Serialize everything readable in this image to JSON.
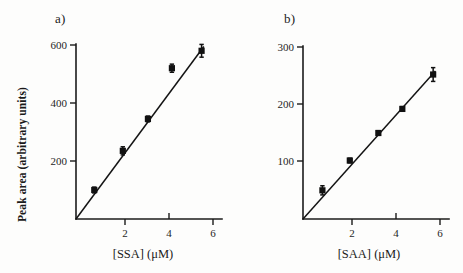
{
  "figure": {
    "background_color": "#fdfdfc",
    "ink_color": "#141414",
    "panel_count": 2
  },
  "panels": {
    "a": {
      "label": "a)",
      "xlabel": "[SSA] (μM)",
      "ylabel": "Peak area (arbitrary units)",
      "xticks": [
        "2",
        "4",
        "6"
      ],
      "yticks": [
        "200",
        "400",
        "600"
      ]
    },
    "b": {
      "label": "b)",
      "xlabel": "[SAA] (μM)",
      "ylabel": "",
      "xticks": [
        "2",
        "4",
        "6"
      ],
      "yticks": [
        "100",
        "200",
        "300"
      ]
    }
  },
  "chart_data": [
    {
      "type": "scatter",
      "panel": "a)",
      "title": "",
      "xlabel": "[SSA] (μM)",
      "ylabel": "Peak area (arbitrary units)",
      "xlim": [
        0,
        6.6
      ],
      "ylim": [
        0,
        640
      ],
      "xticks": [
        2,
        4,
        6
      ],
      "yticks": [
        200,
        400,
        600
      ],
      "grid": false,
      "legend": "none",
      "marker": "filled-square",
      "errorbars": true,
      "x": [
        0.8,
        2.05,
        3.15,
        4.2,
        5.5
      ],
      "y": [
        100,
        235,
        345,
        520,
        580
      ],
      "yerr": [
        10,
        14,
        10,
        14,
        22
      ],
      "fit": {
        "type": "linear",
        "slope": 108,
        "intercept": 0,
        "through_origin": true,
        "x_start": 0,
        "y_start": 0,
        "x_end": 5.6,
        "y_end": 595
      }
    },
    {
      "type": "scatter",
      "panel": "b)",
      "title": "",
      "xlabel": "[SAA] (μM)",
      "ylabel": "",
      "xlim": [
        0,
        6.6
      ],
      "ylim": [
        0,
        320
      ],
      "xticks": [
        2,
        4,
        6
      ],
      "yticks": [
        100,
        200,
        300
      ],
      "grid": false,
      "legend": "none",
      "marker": "filled-square",
      "errorbars": true,
      "x": [
        0.85,
        2.05,
        3.3,
        4.35,
        5.7
      ],
      "y": [
        50,
        102,
        150,
        192,
        252
      ],
      "yerr": [
        8,
        4,
        4,
        4,
        12
      ],
      "fit": {
        "type": "linear",
        "slope": 44.5,
        "intercept": 0,
        "through_origin": true,
        "x_start": 0,
        "y_start": 0,
        "x_end": 5.8,
        "y_end": 258
      }
    }
  ]
}
